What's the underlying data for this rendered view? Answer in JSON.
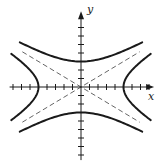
{
  "chart_data": {
    "type": "line",
    "title": "",
    "xlabel": "x",
    "ylabel": "y",
    "xlim": [
      -8.4,
      8.6
    ],
    "ylim": [
      -8.6,
      8.9
    ],
    "grid": false,
    "tick_step": 1,
    "x_ticks": [
      -8,
      -7,
      -6,
      -5,
      -4,
      -3,
      -2,
      -1,
      1,
      2,
      3,
      4,
      5,
      6,
      7,
      8
    ],
    "y_ticks": [
      -8,
      -7,
      -6,
      -5,
      -4,
      -3,
      -2,
      -1,
      1,
      2,
      3,
      4,
      5,
      6,
      7
    ],
    "series": [
      {
        "name": "horizontal hyperbola",
        "equation": "x^2/25 - y^2/9 = 1",
        "a": 5,
        "b": 3,
        "orientation": "horizontal",
        "style": "solid",
        "vertices": [
          [
            -5,
            0
          ],
          [
            5,
            0
          ]
        ],
        "y_range": [
          -3.9,
          3.9
        ]
      },
      {
        "name": "vertical hyperbola",
        "equation": "y^2/9 - x^2/25 = 1",
        "a": 3,
        "b": 5,
        "orientation": "vertical",
        "style": "solid",
        "vertices": [
          [
            0,
            -3
          ],
          [
            0,
            3
          ]
        ],
        "x_range": [
          -7.2,
          7.2
        ]
      },
      {
        "name": "asymptote 1",
        "equation": "y = (3/5)x",
        "style": "dashed",
        "x_range": [
          -6.9,
          6.9
        ]
      },
      {
        "name": "asymptote 2",
        "equation": "y = -(3/5)x",
        "style": "dashed",
        "x_range": [
          -6.9,
          6.9
        ]
      }
    ],
    "colors": {
      "axis": "#1a1a1a",
      "curve": "#1a1a1a",
      "asymptote": "#555555"
    }
  },
  "labels": {
    "x_axis": "x",
    "y_axis": "y"
  }
}
